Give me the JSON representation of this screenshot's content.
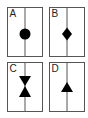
{
  "figure": {
    "panels": [
      {
        "label": "A",
        "shape": "circle"
      },
      {
        "label": "B",
        "shape": "diamond"
      },
      {
        "label": "C",
        "shape": "hourglass"
      },
      {
        "label": "D",
        "shape": "triangle-up"
      }
    ],
    "colors": {
      "stroke": "#555555",
      "fill": "#000000",
      "background": "#ffffff"
    }
  }
}
